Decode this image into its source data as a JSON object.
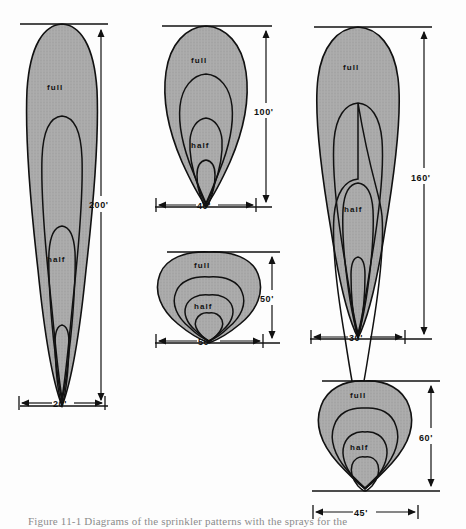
{
  "figure": {
    "caption": "Figure 11-1  Diagrams of the sprinkler patterns with the sprays for the",
    "background_color": "#fdfdfd",
    "fill_color": "#a9a9a9",
    "line_color": "#111111"
  },
  "patterns": [
    {
      "id": "pattern-200ft",
      "full_label": "full",
      "half_label": "half",
      "width_dim": "20'",
      "height_dim": "200'",
      "shape": "narrow-long-plume",
      "contours": 4
    },
    {
      "id": "pattern-100ft",
      "full_label": "full",
      "half_label": "half",
      "width_dim": "40'",
      "height_dim": "100'",
      "shape": "teardrop-plume",
      "contours": 4
    },
    {
      "id": "pattern-160ft",
      "full_label": "full",
      "half_label": "half",
      "width_dim": "30'",
      "height_dim": "160'",
      "shape": "long-tapered-plume",
      "contours": 4
    },
    {
      "id": "pattern-50ft",
      "full_label": "full",
      "half_label": "half",
      "width_dim": "50'",
      "height_dim": "50'",
      "shape": "wide-fan",
      "contours": 4
    },
    {
      "id": "pattern-60ft",
      "full_label": "full",
      "half_label": "half",
      "width_dim": "45'",
      "height_dim": "60'",
      "shape": "broad-teardrop",
      "contours": 4
    }
  ]
}
